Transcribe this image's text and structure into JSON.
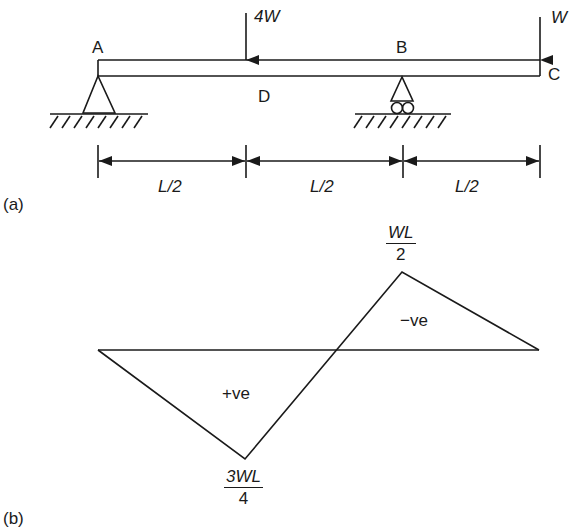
{
  "part_a": {
    "caption": "(a)",
    "points": {
      "A": "A",
      "B": "B",
      "C": "C",
      "D": "D"
    },
    "loads": {
      "load_mid": "4W",
      "load_end": "W"
    },
    "dimensions": [
      "L/2",
      "L/2",
      "L/2"
    ]
  },
  "part_b": {
    "caption": "(b)",
    "peak_positive": {
      "numerator": "3WL",
      "denominator": "4"
    },
    "peak_negative": {
      "numerator": "WL",
      "denominator": "2"
    },
    "region_positive": "+ve",
    "region_negative": "−ve"
  },
  "colors": {
    "ink": "#1a1a1a",
    "background": "#ffffff"
  }
}
